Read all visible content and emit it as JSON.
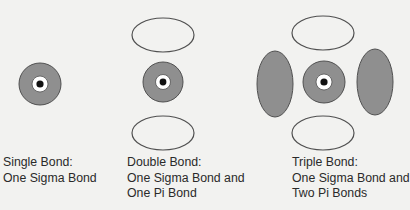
{
  "colors": {
    "background": "#f2f2f0",
    "sigma_fill": "#8f8f8f",
    "pi_fill_shaded": "#8f8f8f",
    "pi_fill_open": "#f2f2f0",
    "outline": "#505050",
    "nucleus": "#111111"
  },
  "panels": [
    {
      "id": "single",
      "caption": [
        "Single Bond:",
        "One Sigma Bond"
      ],
      "sigma": {
        "cx": 40,
        "cy": 84,
        "r": 21
      },
      "pi_lobes": []
    },
    {
      "id": "double",
      "caption": [
        "Double Bond:",
        "One Sigma Bond and",
        "One Pi Bond"
      ],
      "sigma": {
        "cx": 163,
        "cy": 82,
        "r": 20
      },
      "pi_lobes": [
        {
          "cx": 163,
          "cy": 35,
          "rx": 31,
          "ry": 17,
          "shaded": false
        },
        {
          "cx": 163,
          "cy": 133,
          "rx": 31,
          "ry": 17,
          "shaded": false
        }
      ]
    },
    {
      "id": "triple",
      "caption": [
        "Triple Bond:",
        "One Sigma Bond and",
        "Two Pi Bonds"
      ],
      "sigma": {
        "cx": 324,
        "cy": 82,
        "r": 21
      },
      "pi_lobes": [
        {
          "cx": 323,
          "cy": 33,
          "rx": 31,
          "ry": 17,
          "shaded": false
        },
        {
          "cx": 323,
          "cy": 133,
          "rx": 31,
          "ry": 17,
          "shaded": false
        },
        {
          "cx": 275,
          "cy": 84,
          "rx": 18,
          "ry": 33,
          "shaded": true
        },
        {
          "cx": 375,
          "cy": 82,
          "rx": 18,
          "ry": 33,
          "shaded": true
        }
      ]
    }
  ]
}
